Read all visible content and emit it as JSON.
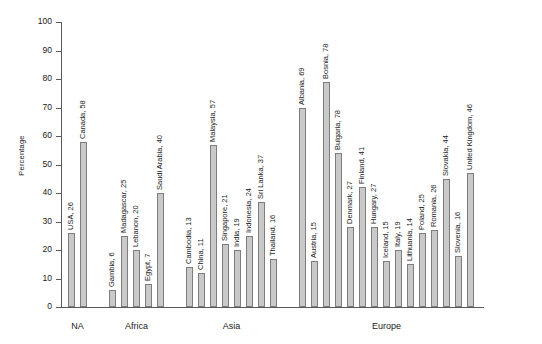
{
  "chart_data": {
    "type": "bar",
    "title": "",
    "xlabel": "",
    "ylabel": "Percentage",
    "ylim": [
      0,
      100
    ],
    "ytick_step": 10,
    "yticks": [
      100,
      90,
      80,
      70,
      60,
      50,
      40,
      30,
      20,
      10,
      0
    ],
    "grid": false,
    "legend": false,
    "orientation": "vertical",
    "label_rotation": 90,
    "label_format": "{country}, {value}",
    "group_axis_labels": [
      "NA",
      "Africa",
      "Asia",
      "Europe"
    ],
    "categories": [
      "USA",
      "Canada",
      "Gambia",
      "Madagascar",
      "Lebanon",
      "Egypt",
      "Saudi Arabia",
      "Cambodia",
      "China",
      "Malaysia",
      "Singapore",
      "India",
      "Indonesia",
      "Sri Lanka",
      "Thailand",
      "Albania",
      "Austria",
      "Bosnia",
      "Bulgaria",
      "Denmark",
      "Finland",
      "Hungary",
      "Iceland",
      "Italy",
      "Lithuania",
      "Poland",
      "Romania",
      "Slovakia",
      "Slovenia",
      "United Kingdom"
    ],
    "values": [
      26,
      58,
      6,
      25,
      20,
      7,
      40,
      13,
      11,
      57,
      21,
      19,
      24,
      37,
      16,
      69,
      15,
      78,
      78,
      27,
      41,
      27,
      15,
      19,
      14,
      25,
      26,
      44,
      16,
      46
    ],
    "groups": [
      {
        "name": "NA",
        "bars": [
          {
            "country": "USA",
            "value": 26,
            "label": "USA, 26",
            "draw": 26
          },
          {
            "country": "Canada",
            "value": 58,
            "label": "Canada, 58",
            "draw": 58
          }
        ]
      },
      {
        "name": "Africa",
        "bars": [
          {
            "country": "Gambia",
            "value": 6,
            "label": "Gambia, 6",
            "draw": 6
          },
          {
            "country": "Madagascar",
            "value": 25,
            "label": "Madagascar, 25",
            "draw": 25
          },
          {
            "country": "Lebanon",
            "value": 20,
            "label": "Lebanon, 20",
            "draw": 20
          },
          {
            "country": "Egypt",
            "value": 7,
            "label": "Egypt, 7",
            "draw": 8
          },
          {
            "country": "Saudi Arabia",
            "value": 40,
            "label": "Saudi Arabia, 40",
            "draw": 40
          }
        ]
      },
      {
        "name": "Asia",
        "bars": [
          {
            "country": "Cambodia",
            "value": 13,
            "label": "Cambodia, 13",
            "draw": 14
          },
          {
            "country": "China",
            "value": 11,
            "label": "China, 11",
            "draw": 12
          },
          {
            "country": "Malaysia",
            "value": 57,
            "label": "Malaysia, 57",
            "draw": 57
          },
          {
            "country": "Singapore",
            "value": 21,
            "label": "Singapore, 21",
            "draw": 22
          },
          {
            "country": "India",
            "value": 19,
            "label": "India, 19",
            "draw": 20
          },
          {
            "country": "Indonesia",
            "value": 24,
            "label": "Indonesia, 24",
            "draw": 25
          },
          {
            "country": "Sri Lanka",
            "value": 37,
            "label": "Sri Lanka, 37",
            "draw": 37
          },
          {
            "country": "Thailand",
            "value": 16,
            "label": "Thailand, 16",
            "draw": 17
          }
        ]
      },
      {
        "name": "Europe",
        "bars": [
          {
            "country": "Albania",
            "value": 69,
            "label": "Albania, 69",
            "draw": 70
          },
          {
            "country": "Austria",
            "value": 15,
            "label": "Austria, 15",
            "draw": 16
          },
          {
            "country": "Bosnia",
            "value": 78,
            "label": "Bosnia, 78",
            "draw": 79
          },
          {
            "country": "Bulgaria",
            "value": 78,
            "label": "Bulgaria, 78",
            "draw": 54
          },
          {
            "country": "Denmark",
            "value": 27,
            "label": "Denmark, 27",
            "draw": 28
          },
          {
            "country": "Finland",
            "value": 41,
            "label": "Finland, 41",
            "draw": 42
          },
          {
            "country": "Hungary",
            "value": 27,
            "label": "Hungary, 27",
            "draw": 28
          },
          {
            "country": "Iceland",
            "value": 15,
            "label": "Iceland, 15",
            "draw": 16
          },
          {
            "country": "Italy",
            "value": 19,
            "label": "Italy, 19",
            "draw": 20
          },
          {
            "country": "Lithuania",
            "value": 14,
            "label": "Lithuania, 14",
            "draw": 15
          },
          {
            "country": "Poland",
            "value": 25,
            "label": "Poland, 25",
            "draw": 26
          },
          {
            "country": "Romania",
            "value": 26,
            "label": "Romania, 26",
            "draw": 27
          },
          {
            "country": "Slovakia",
            "value": 44,
            "label": "Slovakia, 44",
            "draw": 45
          },
          {
            "country": "Slovenia",
            "value": 16,
            "label": "Slovenia, 16",
            "draw": 18
          },
          {
            "country": "United Kingdom",
            "value": 46,
            "label": "United Kingdom, 46",
            "draw": 47
          }
        ]
      }
    ],
    "colors": {
      "bar_fill": "#c9c9c9",
      "bar_stroke": "#7d7d7d",
      "axis": "#5a5a5a",
      "text": "#1a1a1a",
      "background": "#ffffff"
    }
  }
}
